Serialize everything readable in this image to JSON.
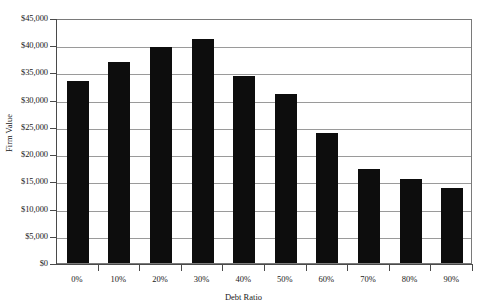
{
  "chart_data": {
    "type": "bar",
    "title": "",
    "xlabel": "Debt Ratio",
    "ylabel": "Firm Value",
    "categories": [
      "0%",
      "10%",
      "20%",
      "30%",
      "40%",
      "50%",
      "60%",
      "70%",
      "80%",
      "90%"
    ],
    "values": [
      33500,
      36900,
      39700,
      41100,
      34300,
      31100,
      23900,
      17200,
      15400,
      13800
    ],
    "ylim": [
      0,
      45000
    ],
    "ytick_values": [
      0,
      5000,
      10000,
      15000,
      20000,
      25000,
      30000,
      35000,
      40000,
      45000
    ],
    "ytick_labels": [
      "$0",
      "$5,000",
      "$10,000",
      "$15,000",
      "$20,000",
      "$25,000",
      "$30,000",
      "$35,000",
      "$40,000",
      "$45,000"
    ],
    "grid": true,
    "legend": false,
    "bar_color": "#0d0d0d",
    "plot_border_color": "#7a7a7a",
    "gridline_color": "#9a9a9a",
    "axis_color": "#4a4a4a",
    "background_color": "#ffffff"
  }
}
